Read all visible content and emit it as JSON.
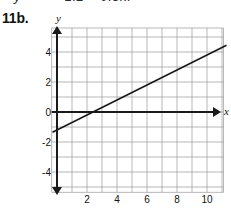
{
  "page": {
    "top_equation_fragment": "= 1.2 + 0.5x.",
    "top_equation_variable": "y",
    "problem_number": "11b."
  },
  "chart_data": {
    "type": "line",
    "title": "",
    "xlabel": "x",
    "ylabel": "y",
    "xlim": [
      -0.4,
      11.6
    ],
    "ylim": [
      -5.6,
      5.6
    ],
    "grid": true,
    "grid_step": 1,
    "legend": "none",
    "x_ticks": [
      2,
      4,
      6,
      8,
      10
    ],
    "x_tick_labels": [
      "2",
      "4",
      "6",
      "8",
      "10"
    ],
    "y_ticks": [
      4,
      2,
      0,
      -2,
      -4
    ],
    "y_tick_labels": [
      "4",
      "2",
      "0",
      "-2",
      "-4"
    ],
    "series": [
      {
        "name": "y = -1.2 + 0.5x",
        "slope": 0.5,
        "intercept": -1.2,
        "x": [
          -0.3,
          11.3
        ],
        "y": [
          -1.35,
          4.45
        ]
      }
    ],
    "x_axis_arrow": "right",
    "y_axis_arrows": "both",
    "axis_color": "#1a1a1a",
    "grid_color": "#9a9a9a",
    "line_color": "#1a1a1a"
  }
}
